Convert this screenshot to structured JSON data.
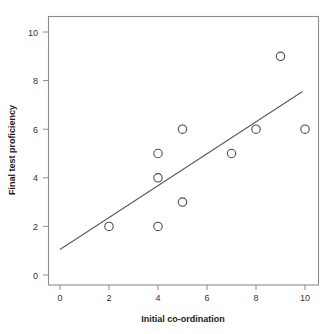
{
  "chart_data": {
    "type": "scatter",
    "title": "",
    "xlabel": "Initial co-ordination",
    "ylabel": "Final test proficiency",
    "xlim": [
      -0.45,
      10.6
    ],
    "ylim": [
      -0.5,
      10.6
    ],
    "xticks": [
      0,
      2,
      4,
      6,
      8,
      10
    ],
    "yticks": [
      0,
      2,
      4,
      6,
      8,
      10
    ],
    "xtick_labels": [
      "0",
      "2",
      "4",
      "6",
      "8",
      "10"
    ],
    "ytick_labels": [
      "0",
      "2",
      "4",
      "6",
      "8",
      "10"
    ],
    "grid": false,
    "legend": null,
    "marker": "open-circle",
    "points": [
      {
        "x": 2,
        "y": 2
      },
      {
        "x": 4,
        "y": 5
      },
      {
        "x": 4,
        "y": 4
      },
      {
        "x": 4,
        "y": 2
      },
      {
        "x": 5,
        "y": 6
      },
      {
        "x": 5,
        "y": 3
      },
      {
        "x": 7,
        "y": 5
      },
      {
        "x": 8,
        "y": 6
      },
      {
        "x": 9,
        "y": 9
      },
      {
        "x": 10,
        "y": 6
      }
    ],
    "x": [
      2,
      4,
      4,
      4,
      5,
      5,
      7,
      8,
      9,
      10
    ],
    "y": [
      2,
      5,
      4,
      2,
      6,
      3,
      5,
      6,
      9,
      6
    ],
    "trendline": {
      "type": "linear-fit",
      "x_start": 0,
      "y_start": 1.05,
      "x_end": 9.9,
      "y_end": 7.55
    },
    "colors": {
      "marker_stroke": "#4d4d4d",
      "line": "#595959",
      "frame": "#8c8c8c",
      "text": "#333333",
      "background": "#ffffff"
    }
  }
}
